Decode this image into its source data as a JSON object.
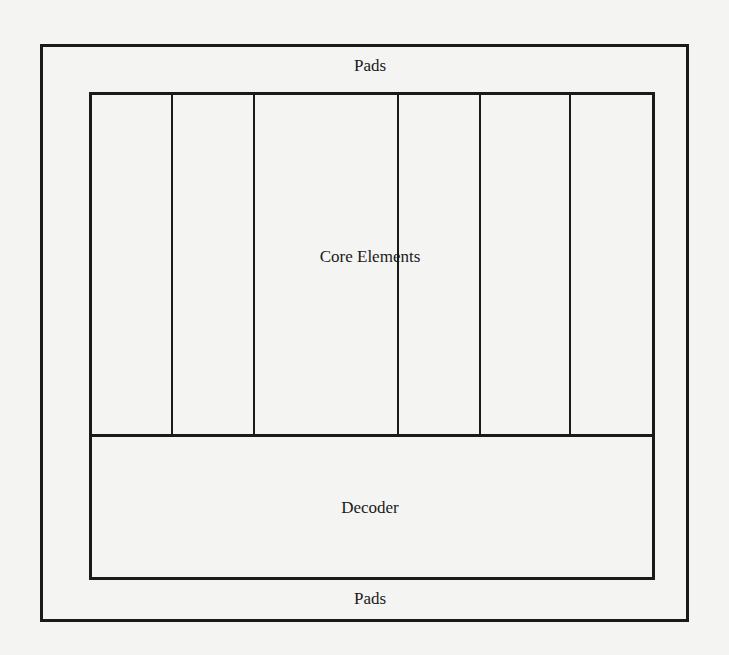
{
  "diagram": {
    "labels": {
      "pads_top": "Pads",
      "core": "Core Elements",
      "decoder": "Decoder",
      "pads_bottom": "Pads"
    },
    "core_column_dividers_x": [
      172,
      254,
      398,
      480,
      570
    ],
    "colors": {
      "line": "#1a1a1a",
      "background": "#f4f4f2"
    }
  }
}
